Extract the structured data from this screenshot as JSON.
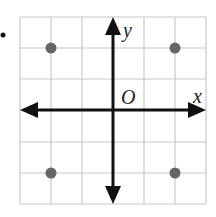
{
  "diagram": {
    "type": "coordinate-plane",
    "grid": {
      "cells": 6,
      "x_range": [
        -3,
        3
      ],
      "y_range": [
        -3,
        3
      ],
      "line_color": "#c8c8c8"
    },
    "axes": {
      "x_label": "x",
      "y_label": "y",
      "origin_label": "O",
      "color": "#111111"
    },
    "points": [
      {
        "x": -2,
        "y": 2
      },
      {
        "x": 2,
        "y": 2
      },
      {
        "x": -2,
        "y": -2
      },
      {
        "x": 2,
        "y": -2
      }
    ],
    "point_color": "#666666",
    "marker_bullet": "•"
  }
}
